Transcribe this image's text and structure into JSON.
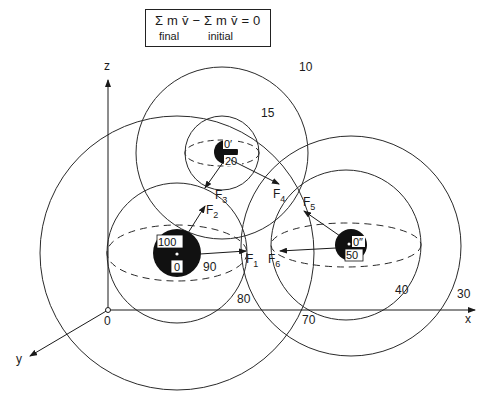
{
  "equation": {
    "main": "Σ m v̄ − Σ m v̄  = 0",
    "sub_final": "final",
    "sub_initial": "initial"
  },
  "axes": {
    "x_label": "x",
    "y_label": "y",
    "z_label": "z",
    "origin_label": "0"
  },
  "masses": [
    {
      "id": "large",
      "top_label": "100",
      "bottom_label": "0"
    },
    {
      "id": "top",
      "top_label": "0′",
      "bottom_label": "20"
    },
    {
      "id": "right",
      "top_label": "0″",
      "bottom_label": "50"
    }
  ],
  "circle_labels": {
    "c10": "10",
    "c15": "15",
    "c30": "30",
    "c40": "40",
    "c70": "70",
    "c80": "80",
    "c90": "90"
  },
  "forces": [
    {
      "name": "F",
      "sub": "1"
    },
    {
      "name": "F",
      "sub": "2"
    },
    {
      "name": "F",
      "sub": "3"
    },
    {
      "name": "F",
      "sub": "4"
    },
    {
      "name": "F",
      "sub": "5"
    },
    {
      "name": "F",
      "sub": "6"
    }
  ],
  "colors": {
    "ink": "#1a1a1a",
    "background": "#ffffff"
  }
}
